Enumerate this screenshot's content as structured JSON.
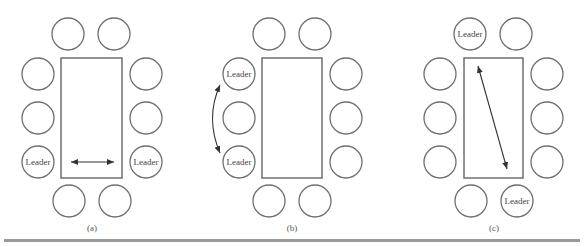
{
  "figure": {
    "panels": [
      {
        "caption": "(a)",
        "leader_label": "Leader",
        "description": "Leaders seated opposite each other across the table width"
      },
      {
        "caption": "(b)",
        "leader_label": "Leader",
        "description": "Leaders seated on the same side of the table"
      },
      {
        "caption": "(c)",
        "leader_label": "Leader",
        "description": "Leaders seated at diagonal opposite ends of the table"
      }
    ],
    "colors": {
      "stroke": "#6f6f6f",
      "arrow": "#333333",
      "rule": "#9a9a9a"
    }
  }
}
